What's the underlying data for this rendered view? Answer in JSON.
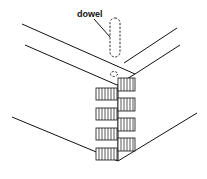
{
  "figure": {
    "labels": {
      "dowel": "dowel"
    },
    "colors": {
      "line": "#111111",
      "background": "#ffffff"
    },
    "joint": {
      "tail_count_left": 5,
      "tail_count_right": 5
    }
  }
}
